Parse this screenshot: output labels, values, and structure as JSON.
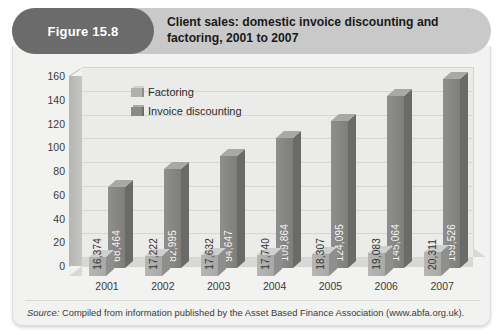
{
  "figure": {
    "pill_label": "Figure 15.8",
    "title": "Client sales: domestic invoice discounting and factoring, 2001 to 2007",
    "source_prefix": "Source:",
    "source_text": " Compiled from information published by the Asset Based Finance Association (www.abfa.org.uk)."
  },
  "colors": {
    "header_bar": "#c9c9c9",
    "pill": "#6b6b6b",
    "panel": "#f2f2f0",
    "factoring": "#b0b0ae",
    "invoice_discounting": "#8a8a88",
    "plot_back_wall": "#ebebe9",
    "gridline": "#d6d6d4"
  },
  "legend": {
    "items": [
      {
        "label": "Factoring",
        "key": "factoring"
      },
      {
        "label": "Invoice discounting",
        "key": "invoice_discounting"
      }
    ]
  },
  "chart_data": {
    "type": "bar",
    "title": "Client sales: domestic invoice discounting and factoring, 2001 to 2007",
    "subtitle": "",
    "xlabel": "",
    "ylabel": "",
    "ylim": [
      0,
      160
    ],
    "ytick_step": 20,
    "yticks": [
      160,
      140,
      120,
      100,
      80,
      60,
      40,
      20,
      0
    ],
    "grid": true,
    "legend_position": "top-left-inside",
    "style": "3d-clustered-column",
    "categories": [
      "2001",
      "2002",
      "2003",
      "2004",
      "2005",
      "2006",
      "2007"
    ],
    "series": [
      {
        "name": "Factoring",
        "values": [
          16.374,
          17.222,
          17.632,
          17.74,
          18.307,
          19.083,
          20.311
        ],
        "labels": [
          "16,374",
          "17,222",
          "17,632",
          "17,740",
          "18,307",
          "19,083",
          "20,311"
        ]
      },
      {
        "name": "Invoice discounting",
        "values": [
          68.464,
          82.995,
          94.647,
          109.864,
          124.095,
          145.064,
          159.526
        ],
        "labels": [
          "68,464",
          "82,995",
          "94,647",
          "109,864",
          "124,095",
          "145,064",
          "159,526"
        ]
      }
    ]
  }
}
